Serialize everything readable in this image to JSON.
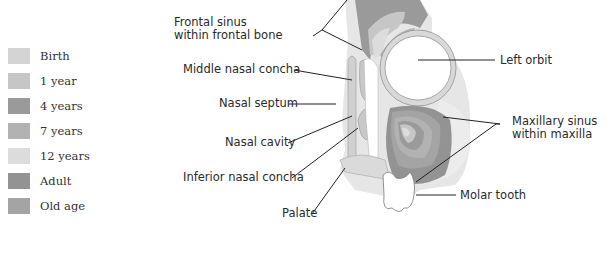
{
  "legend": {
    "items": [
      {
        "label": "Birth",
        "color": "#d4d4d4"
      },
      {
        "label": "1 year",
        "color": "#c6c6c6"
      },
      {
        "label": "4 years",
        "color": "#9a9a9a"
      },
      {
        "label": "7 years",
        "color": "#b2b2b2"
      },
      {
        "label": "12 years",
        "color": "#dcdcdc"
      },
      {
        "label": "Adult",
        "color": "#939393"
      },
      {
        "label": "Old age",
        "color": "#a4a4a4"
      }
    ]
  },
  "labels": {
    "frontal_sinus_1": "Frontal sinus",
    "frontal_sinus_2": "within frontal bone",
    "middle_nasal_concha": "Middle nasal concha",
    "nasal_septum": "Nasal septum",
    "nasal_cavity": "Nasal cavity",
    "inferior_nasal_concha": "Inferior nasal concha",
    "palate": "Palate",
    "left_orbit": "Left orbit",
    "maxillary_sinus_1": "Maxillary sinus",
    "maxillary_sinus_2": "within maxilla",
    "molar_tooth": "Molar tooth"
  }
}
